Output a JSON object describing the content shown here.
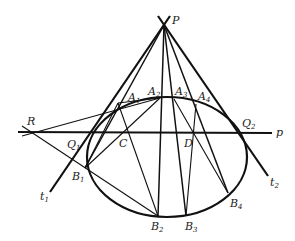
{
  "figure": {
    "points": {
      "P": {
        "label": "P",
        "x": 164,
        "y": 25
      },
      "R": {
        "label": "R",
        "x": 30,
        "y": 132
      },
      "Q1": {
        "label": "Q",
        "sub": "1",
        "x": 90,
        "y": 132
      },
      "Q2": {
        "label": "Q",
        "sub": "2",
        "x": 241,
        "y": 133
      },
      "C": {
        "label": "C",
        "x": 125,
        "y": 132
      },
      "D": {
        "label": "D",
        "x": 193,
        "y": 133
      },
      "A1": {
        "label": "A",
        "sub": "1",
        "x": 118,
        "y": 103
      },
      "A2": {
        "label": "A",
        "sub": "2",
        "x": 160,
        "y": 98
      },
      "A3": {
        "label": "A",
        "sub": "3",
        "x": 174,
        "y": 99
      },
      "A4": {
        "label": "A",
        "sub": "4",
        "x": 196,
        "y": 104
      },
      "B1": {
        "label": "B",
        "sub": "1",
        "x": 85,
        "y": 168
      },
      "B2": {
        "label": "B",
        "sub": "2",
        "x": 158,
        "y": 216
      },
      "B3": {
        "label": "B",
        "sub": "3",
        "x": 186,
        "y": 216
      },
      "B4": {
        "label": "B",
        "sub": "4",
        "x": 228,
        "y": 193
      }
    },
    "lines": {
      "polar": {
        "label": "p"
      },
      "tangent1": {
        "label": "t",
        "sub": "1"
      },
      "tangent2": {
        "label": "t",
        "sub": "2"
      }
    },
    "conic": {
      "type": "ellipse",
      "cx": 167,
      "cy": 157,
      "rx": 80,
      "ry": 60
    }
  }
}
